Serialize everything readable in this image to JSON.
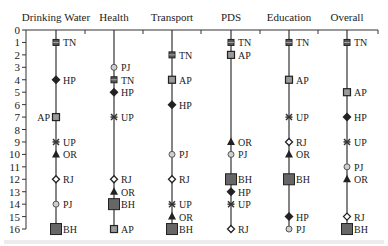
{
  "chart_data": {
    "type": "scatter",
    "title": "",
    "subtitle": "Rank of states across sectors (parallel rank plot)",
    "xlabel": "",
    "ylabel": "",
    "ylim": [
      0,
      16
    ],
    "y_inverted": true,
    "y_ticks": [
      0,
      1,
      2,
      3,
      4,
      5,
      6,
      7,
      8,
      9,
      10,
      11,
      12,
      13,
      14,
      15,
      16
    ],
    "grid": false,
    "legend": "none (labels placed beside markers)",
    "categories": [
      "Drinking Water",
      "Health",
      "Transport",
      "PDS",
      "Education",
      "Overall"
    ],
    "markers": {
      "TN": {
        "shape": "square-small",
        "fill": "#555555"
      },
      "AP": {
        "shape": "square",
        "fill": "#9a9a9a"
      },
      "HP": {
        "shape": "diamond",
        "fill": "#222222"
      },
      "UP": {
        "shape": "asterisk",
        "fill": "#333333"
      },
      "OR": {
        "shape": "triangle",
        "fill": "#222222"
      },
      "RJ": {
        "shape": "diamond-open",
        "fill": "#ffffff"
      },
      "PJ": {
        "shape": "circle",
        "fill": "#cfcfcf"
      },
      "BH": {
        "shape": "square-large",
        "fill": "#666666"
      }
    },
    "series": [
      {
        "name": "Drinking Water",
        "points": [
          {
            "state": "TN",
            "rank": 1
          },
          {
            "state": "HP",
            "rank": 4
          },
          {
            "state": "AP",
            "rank": 7,
            "label_side": "left"
          },
          {
            "state": "UP",
            "rank": 9
          },
          {
            "state": "OR",
            "rank": 10
          },
          {
            "state": "RJ",
            "rank": 12
          },
          {
            "state": "PJ",
            "rank": 14
          },
          {
            "state": "BH",
            "rank": 16
          }
        ]
      },
      {
        "name": "Health",
        "points": [
          {
            "state": "PJ",
            "rank": 3
          },
          {
            "state": "TN",
            "rank": 4
          },
          {
            "state": "HP",
            "rank": 5
          },
          {
            "state": "UP",
            "rank": 7
          },
          {
            "state": "RJ",
            "rank": 12
          },
          {
            "state": "OR",
            "rank": 13
          },
          {
            "state": "BH",
            "rank": 14
          },
          {
            "state": "AP",
            "rank": 16
          }
        ]
      },
      {
        "name": "Transport",
        "points": [
          {
            "state": "TN",
            "rank": 2
          },
          {
            "state": "AP",
            "rank": 4
          },
          {
            "state": "HP",
            "rank": 6
          },
          {
            "state": "PJ",
            "rank": 10
          },
          {
            "state": "RJ",
            "rank": 12
          },
          {
            "state": "UP",
            "rank": 14
          },
          {
            "state": "OR",
            "rank": 15
          },
          {
            "state": "BH",
            "rank": 16
          }
        ]
      },
      {
        "name": "PDS",
        "points": [
          {
            "state": "TN",
            "rank": 1
          },
          {
            "state": "AP",
            "rank": 2
          },
          {
            "state": "OR",
            "rank": 9
          },
          {
            "state": "PJ",
            "rank": 10
          },
          {
            "state": "BH",
            "rank": 12
          },
          {
            "state": "HP",
            "rank": 13
          },
          {
            "state": "UP",
            "rank": 14
          },
          {
            "state": "RJ",
            "rank": 16
          }
        ]
      },
      {
        "name": "Education",
        "points": [
          {
            "state": "TN",
            "rank": 1
          },
          {
            "state": "AP",
            "rank": 4
          },
          {
            "state": "UP",
            "rank": 7
          },
          {
            "state": "RJ",
            "rank": 9
          },
          {
            "state": "OR",
            "rank": 10
          },
          {
            "state": "BH",
            "rank": 12
          },
          {
            "state": "HP",
            "rank": 15
          },
          {
            "state": "PJ",
            "rank": 16
          }
        ]
      },
      {
        "name": "Overall",
        "points": [
          {
            "state": "TN",
            "rank": 1
          },
          {
            "state": "AP",
            "rank": 5
          },
          {
            "state": "HP",
            "rank": 7
          },
          {
            "state": "UP",
            "rank": 9
          },
          {
            "state": "PJ",
            "rank": 11
          },
          {
            "state": "OR",
            "rank": 12
          },
          {
            "state": "RJ",
            "rank": 15
          },
          {
            "state": "BH",
            "rank": 16
          }
        ]
      }
    ]
  },
  "layout": {
    "axis_x": 26,
    "axis_right": 378,
    "y0": 30,
    "y_step": 12.44,
    "column_x": [
      56,
      114,
      172,
      231,
      289,
      347
    ],
    "minor_tick_x": [
      85,
      143,
      201,
      260,
      318
    ],
    "line_color": "#333333"
  }
}
